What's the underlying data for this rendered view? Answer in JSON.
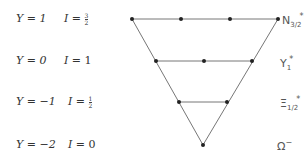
{
  "rows": [
    {
      "y_label": "Y = 1",
      "i_label": "I = ",
      "i_frac": [
        "3",
        "2"
      ],
      "i_value": "",
      "particle": "N",
      "particle_sub": "3/2",
      "particle_sup": "*",
      "points_x": [
        132,
        181,
        230,
        278
      ],
      "y": 19
    },
    {
      "y_label": "Y = 0",
      "i_label": "I = ",
      "i_frac": null,
      "i_value": "1",
      "particle": "Y",
      "particle_sub": "1",
      "particle_sup": "*",
      "points_x": [
        156,
        204,
        252
      ],
      "y": 61
    },
    {
      "y_label": "Y = −1",
      "i_label": "I = ",
      "i_frac": [
        "1",
        "2"
      ],
      "i_value": "",
      "particle": "Ξ",
      "particle_sub": "1/2",
      "particle_sup": "*",
      "points_x": [
        179,
        227
      ],
      "y": 102
    },
    {
      "y_label": "Y = −2",
      "i_label": "I = ",
      "i_frac": null,
      "i_value": "0",
      "particle": "Ω",
      "particle_sub": "",
      "particle_sup": "−",
      "points_x": [
        203
      ],
      "y": 145
    }
  ],
  "colors": {
    "line": "#666666",
    "point": "#222222",
    "text": "#333333"
  }
}
